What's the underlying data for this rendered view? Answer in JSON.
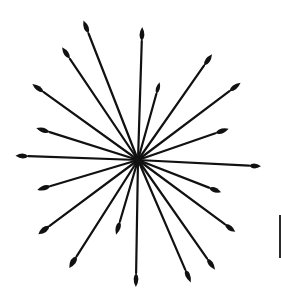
{
  "figure": {
    "ink_color": "#111111",
    "background_color": "#ffffff",
    "center": [
      138,
      160
    ],
    "spokes": [
      {
        "tip": [
          86,
          27
        ],
        "len": 14,
        "w": 6
      },
      {
        "tip": [
          66,
          53
        ],
        "len": 14,
        "w": 6
      },
      {
        "tip": [
          38,
          88
        ],
        "len": 14,
        "w": 6
      },
      {
        "tip": [
          43,
          130
        ],
        "len": 14,
        "w": 6
      },
      {
        "tip": [
          22,
          156
        ],
        "len": 13,
        "w": 6
      },
      {
        "tip": [
          142,
          34
        ],
        "len": 14,
        "w": 6
      },
      {
        "tip": [
          158,
          88
        ],
        "len": 12,
        "w": 5
      },
      {
        "tip": [
          208,
          60
        ],
        "len": 14,
        "w": 6
      },
      {
        "tip": [
          235,
          87
        ],
        "len": 14,
        "w": 6
      },
      {
        "tip": [
          222,
          131
        ],
        "len": 14,
        "w": 6
      },
      {
        "tip": [
          255,
          166
        ],
        "len": 12,
        "w": 6
      },
      {
        "tip": [
          44,
          188
        ],
        "len": 14,
        "w": 6
      },
      {
        "tip": [
          44,
          230
        ],
        "len": 14,
        "w": 7
      },
      {
        "tip": [
          73,
          262
        ],
        "len": 14,
        "w": 7
      },
      {
        "tip": [
          118,
          228
        ],
        "len": 14,
        "w": 6
      },
      {
        "tip": [
          136,
          280
        ],
        "len": 14,
        "w": 6
      },
      {
        "tip": [
          215,
          190
        ],
        "len": 13,
        "w": 6
      },
      {
        "tip": [
          230,
          228
        ],
        "len": 13,
        "w": 6
      },
      {
        "tip": [
          211,
          264
        ],
        "len": 14,
        "w": 6
      },
      {
        "tip": [
          188,
          276
        ],
        "len": 14,
        "w": 6
      }
    ],
    "stray_mark": {
      "x": 279,
      "y": 215,
      "height": 43
    }
  }
}
